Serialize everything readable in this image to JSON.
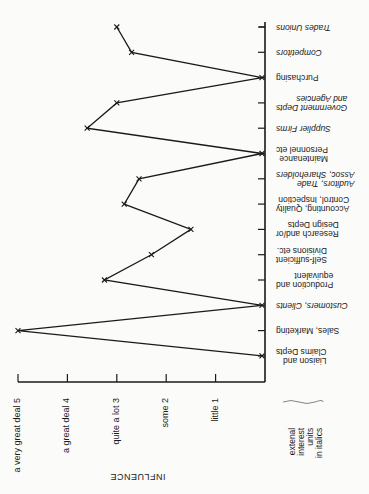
{
  "chart_data": {
    "type": "line",
    "orientation": "rotated: categories along vertical axis (right), influence increases leftward; category labels printed upside-down",
    "title": "",
    "xlabel": "INFLUENCE",
    "ylabel": "",
    "xlim": [
      0,
      5
    ],
    "grid": false,
    "scale_ticks": [
      {
        "value": 5,
        "label": "a very great deal   5"
      },
      {
        "value": 4,
        "label": "a great deal   4"
      },
      {
        "value": 3,
        "label": "quite a lot   3"
      },
      {
        "value": 2,
        "label": "some   2"
      },
      {
        "value": 1,
        "label": "little   1"
      }
    ],
    "categories": [
      {
        "label": "Trades Unions",
        "external": true,
        "value": 3.0
      },
      {
        "label": "Competitors",
        "external": true,
        "value": 2.7
      },
      {
        "label": "Purchasing",
        "external": false,
        "value": 0
      },
      {
        "label": "Government Depts\nand Agencies",
        "external": true,
        "value": 3.0
      },
      {
        "label": "Supplier Firms",
        "external": true,
        "value": 3.6
      },
      {
        "label": "Maintenance\nPersonnel etc",
        "external": false,
        "value": 0
      },
      {
        "label": "Auditors, Trade\nAssoc, Shareholders",
        "external": true,
        "value": 2.55
      },
      {
        "label": "Accounting, Quality\nControl, Inspection",
        "external": false,
        "value": 2.85
      },
      {
        "label": "Research and/or\nDesign Depts",
        "external": false,
        "value": 1.5
      },
      {
        "label": "Self-sufficient\nDivisions etc.",
        "external": false,
        "value": 2.3
      },
      {
        "label": "Production and\nequivalent",
        "external": false,
        "value": 3.25
      },
      {
        "label": "Customers, Clients",
        "external": true,
        "value": 0
      },
      {
        "label": "Sales, Marketing",
        "external": false,
        "value": 5.0
      },
      {
        "label": "Liaison and\nClaims Depts",
        "external": false,
        "value": 0
      }
    ],
    "legend_note": "extenal\ninterest\nunits\nin italics",
    "line_color": "#1a1a1a"
  }
}
